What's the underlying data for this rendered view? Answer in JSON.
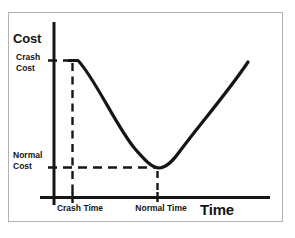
{
  "labels": {
    "y_axis_title": "Cost",
    "crash_cost": "Crash\nCost",
    "normal_cost": "Normal\nCost",
    "crash_time": "Crash Time",
    "normal_time": "Normal Time",
    "x_axis_title": "Time"
  },
  "colors": {
    "line": "#161616",
    "text": "#141414",
    "frame_border": "#b2b2b2",
    "background": "#ffffff"
  },
  "geometry": {
    "y_axis_d": "M 54 22 V 205",
    "x_axis_d": "M 40 197.5 H 270",
    "crash_cost_dash_d": "M 48 60.5 H 77",
    "normal_cost_dash_d": "M 48 167.5 H 156",
    "crash_time_dash_d": "M 72.5 63 V 194",
    "normal_time_dash_d": "M 157.5 171 V 193",
    "crash_time_tick_d": "M 72.5 192 V 203",
    "normal_time_tick_d": "M 157.5 192 V 202",
    "curve_d": "M 69 60.5 L 78 60.5 C 95 78 118 130 136 150 C 146 161 152 168 159 168 C 166 168 172 162 180 151 C 200 124 228 92 248 62"
  },
  "chart_data": {
    "type": "line",
    "title": "",
    "xlabel": "Time",
    "ylabel": "Cost",
    "x_tick_labels": [
      "Crash Time",
      "Normal Time"
    ],
    "y_tick_labels": [
      "Crash Cost",
      "Normal Cost"
    ],
    "axis_ranges": "unlabeled (conceptual time-cost tradeoff diagram)",
    "grid": false,
    "legend": false,
    "series": [
      {
        "name": "cost-vs-time curve",
        "units": "normalized 0-1 plot coordinates",
        "x": [
          0.07,
          0.11,
          0.21,
          0.31,
          0.38,
          0.43,
          0.49,
          0.55,
          0.61,
          0.7,
          0.81,
          0.9
        ],
        "y": [
          0.78,
          0.78,
          0.61,
          0.4,
          0.27,
          0.2,
          0.17,
          0.2,
          0.29,
          0.43,
          0.61,
          0.77
        ]
      }
    ],
    "key_points": {
      "crash": {
        "x_label": "Crash Time",
        "y_label": "Crash Cost",
        "x_normalized": 0.09,
        "y_normalized": 0.78,
        "note": "left end of curve, maximum cost shown by dashed guides"
      },
      "normal": {
        "x_label": "Normal Time",
        "y_label": "Normal Cost",
        "x_normalized": 0.48,
        "y_normalized": 0.17,
        "note": "curve minimum, marked by dashed guides"
      }
    },
    "annotations": [
      "dashed horizontal guide at Crash Cost level",
      "dashed horizontal guide at Normal Cost level",
      "dashed vertical guide at Crash Time",
      "dashed vertical guide at Normal Time"
    ]
  }
}
